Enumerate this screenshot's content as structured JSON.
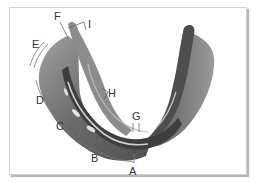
{
  "diagram": {
    "labels": [
      {
        "id": "A",
        "text": "A"
      },
      {
        "id": "B",
        "text": "B"
      },
      {
        "id": "C",
        "text": "C"
      },
      {
        "id": "D",
        "text": "D"
      },
      {
        "id": "E",
        "text": "E"
      },
      {
        "id": "F",
        "text": "F"
      },
      {
        "id": "G",
        "text": "G"
      },
      {
        "id": "H",
        "text": "H"
      },
      {
        "id": "I",
        "text": "I"
      }
    ]
  },
  "colors": {
    "frame_border": "#cfcfcf",
    "shadow": "#b5b5b5",
    "guard_dark": "#4a4a4a",
    "guard_mid": "#7a7a7a",
    "guard_light": "#a8a8a8",
    "highlight": "#d8d8d8",
    "label": "#333333"
  }
}
